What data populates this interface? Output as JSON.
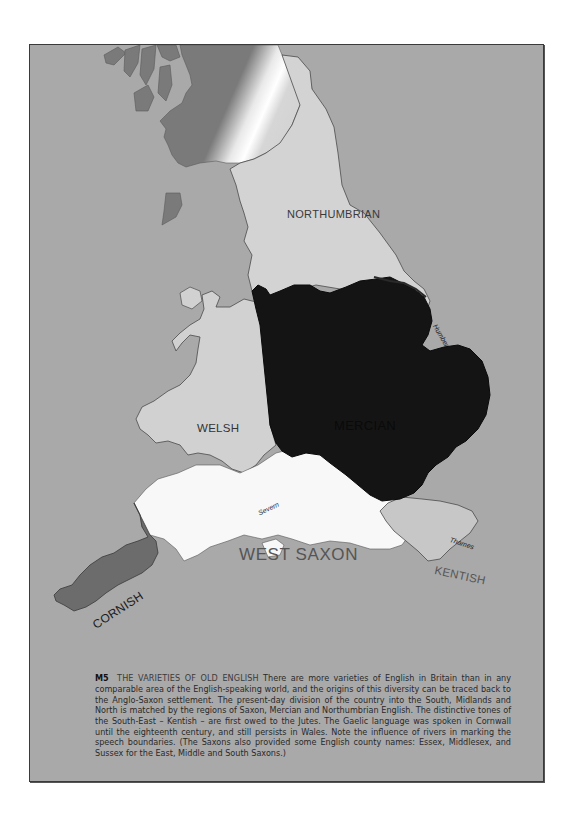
{
  "figure": {
    "code": "M5",
    "title": "THE VARIETIES OF OLD ENGLISH",
    "caption": "There are more varieties of English in Britain than in any comparable area of the English-speaking world, and the origins of this diversity can be traced back to the Anglo-Saxon settlement. The present-day division of the country into the South, Midlands and North is matched by the regions of Saxon, Mercian and Northumbrian English. The distinctive tones of the South-East – Kentish – are first owed to the Jutes. The Gaelic language was spoken in Cornwall until the eighteenth century, and still persists in Wales. Note the influence of rivers in marking the speech boundaries. (The Saxons also provided some English county names: Essex, Middlesex, and Sussex for the East, Middle and South Saxons.)"
  },
  "map": {
    "regions": [
      {
        "id": "northumbrian",
        "label": "NORTHUMBRIAN",
        "color": "#d3d3d3"
      },
      {
        "id": "mercian",
        "label": "MERCIAN",
        "color": "#141414"
      },
      {
        "id": "welsh",
        "label": "WELSH",
        "color": "#d1d1d1"
      },
      {
        "id": "west-saxon",
        "label": "WEST SAXON",
        "color": "#f8f8f8"
      },
      {
        "id": "cornish",
        "label": "CORNISH",
        "color": "#6c6c6c"
      },
      {
        "id": "kentish",
        "label": "KENTISH",
        "color": "#c7c7c7"
      }
    ],
    "rivers": [
      {
        "id": "humber",
        "label": "Humber"
      },
      {
        "id": "severn",
        "label": "Severn"
      },
      {
        "id": "thames",
        "label": "Thames"
      }
    ],
    "colors": {
      "sea": "#a9a9a9",
      "scotland": "#7a7a7a",
      "border": "#3a3a3a"
    }
  }
}
